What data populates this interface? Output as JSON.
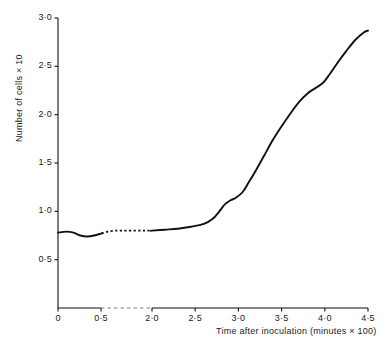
{
  "chart_data": {
    "type": "line",
    "title": "",
    "xlabel": "Time after inoculation (minutes × 100)",
    "ylabel": "Number of cells × 10",
    "xlim": [
      0,
      4.5
    ],
    "ylim": [
      0,
      3.0
    ],
    "grid": false,
    "legend": "none",
    "axis_break": {
      "axis": "x",
      "from": 0.5,
      "to": 2.0,
      "style": "dashed",
      "note": "x-axis and curve drawn dashed across the break"
    },
    "xticks": [
      0,
      0.5,
      2.0,
      2.5,
      3.0,
      3.5,
      4.0,
      4.5
    ],
    "xtick_labels": [
      "0",
      "0·5",
      "2·0",
      "2·5",
      "3·0",
      "3·5",
      "4·0",
      "4·5"
    ],
    "yticks": [
      0.5,
      1.0,
      1.5,
      2.0,
      2.5,
      3.0
    ],
    "ytick_labels": [
      "0·5",
      "1·0",
      "1·5",
      "2·0",
      "2·5",
      "3·0"
    ],
    "series": [
      {
        "name": "cell count",
        "style": "solid-with-dashed-break",
        "color": "#111111",
        "points": [
          [
            0.0,
            0.78
          ],
          [
            0.1,
            0.79
          ],
          [
            0.18,
            0.78
          ],
          [
            0.26,
            0.75
          ],
          [
            0.34,
            0.74
          ],
          [
            0.42,
            0.75
          ],
          [
            0.5,
            0.77
          ],
          [
            0.7,
            0.79
          ],
          [
            0.9,
            0.8
          ],
          [
            1.1,
            0.8
          ],
          [
            1.3,
            0.8
          ],
          [
            1.5,
            0.8
          ],
          [
            1.7,
            0.8
          ],
          [
            1.85,
            0.8
          ],
          [
            2.0,
            0.8
          ],
          [
            2.15,
            0.81
          ],
          [
            2.3,
            0.82
          ],
          [
            2.45,
            0.84
          ],
          [
            2.6,
            0.87
          ],
          [
            2.7,
            0.92
          ],
          [
            2.78,
            1.0
          ],
          [
            2.84,
            1.07
          ],
          [
            2.9,
            1.11
          ],
          [
            2.97,
            1.14
          ],
          [
            3.05,
            1.2
          ],
          [
            3.12,
            1.3
          ],
          [
            3.2,
            1.42
          ],
          [
            3.3,
            1.58
          ],
          [
            3.4,
            1.74
          ],
          [
            3.5,
            1.88
          ],
          [
            3.6,
            2.01
          ],
          [
            3.7,
            2.13
          ],
          [
            3.8,
            2.22
          ],
          [
            3.9,
            2.28
          ],
          [
            3.98,
            2.33
          ],
          [
            4.05,
            2.41
          ],
          [
            4.15,
            2.54
          ],
          [
            4.25,
            2.66
          ],
          [
            4.35,
            2.77
          ],
          [
            4.45,
            2.85
          ],
          [
            4.5,
            2.87
          ]
        ],
        "dashed_range_x": [
          0.52,
          1.98
        ]
      }
    ]
  },
  "axes": {
    "y_title": "Number of cells × 10",
    "x_title": "Time after inoculation (minutes × 100)"
  }
}
